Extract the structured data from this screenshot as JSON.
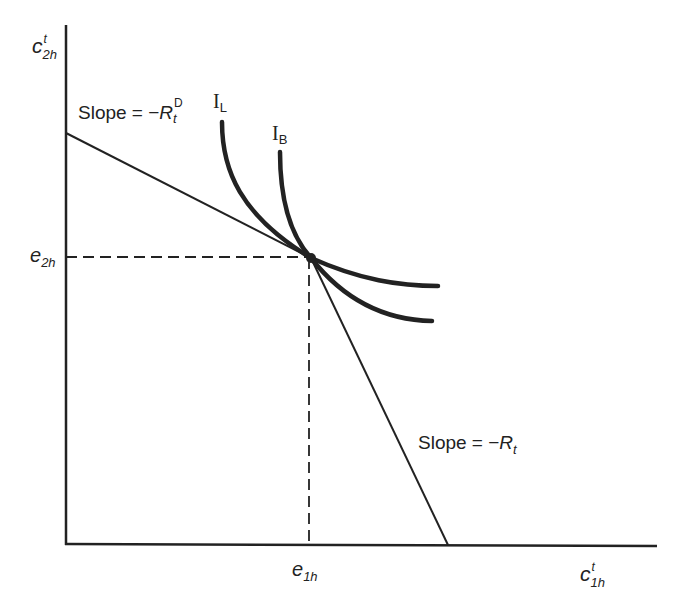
{
  "figure": {
    "type": "consumption budget / indifference curve diagram",
    "colors": {
      "ink": "#222222",
      "background": "#ffffff"
    }
  },
  "axes": {
    "y_label": {
      "base": "c",
      "sup": "t",
      "sub": "2h"
    },
    "x_label": {
      "base": "c",
      "sup": "t",
      "sub": "1h"
    }
  },
  "ticks": {
    "y_tick": {
      "base": "e",
      "sub": "2h"
    },
    "x_tick": {
      "base": "e",
      "sub": "1h"
    }
  },
  "lines": {
    "upper_budget": {
      "label_prefix": "Slope = −",
      "label_var": "R",
      "label_sub": "t",
      "label_sup": "D"
    },
    "lower_budget": {
      "label_prefix": "Slope = −",
      "label_var": "R",
      "label_sub": "t"
    }
  },
  "curves": {
    "lender": {
      "label": "I",
      "sub": "L"
    },
    "borrower": {
      "label": "I",
      "sub": "B"
    }
  },
  "endowment_point": {
    "label": ""
  }
}
